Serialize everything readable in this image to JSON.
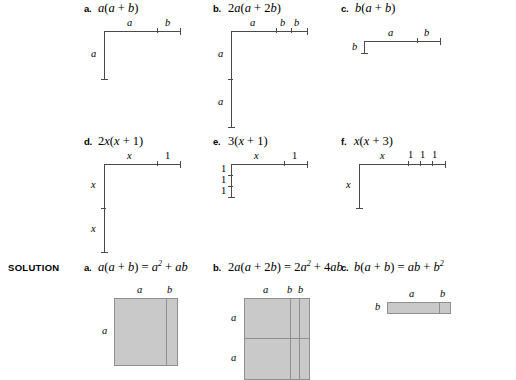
{
  "page": {
    "solution_tag": "SOLUTION"
  },
  "problems": [
    {
      "letter": "a.",
      "expression": "a(a + b)",
      "expr_parts": [
        "a",
        "(",
        "a",
        " + ",
        "b",
        ")"
      ],
      "horizontal_labels": [
        "a",
        "b"
      ],
      "vertical_labels": [
        "a"
      ]
    },
    {
      "letter": "b.",
      "expression": "2a(a + 2b)",
      "horizontal_labels": [
        "a",
        "b",
        "b"
      ],
      "vertical_labels": [
        "a",
        "a"
      ]
    },
    {
      "letter": "c.",
      "expression": "b(a + b)",
      "horizontal_labels": [
        "a",
        "b"
      ],
      "vertical_labels": [
        "b"
      ]
    },
    {
      "letter": "d.",
      "expression": "2x(x + 1)",
      "horizontal_labels": [
        "x",
        "1"
      ],
      "vertical_labels": [
        "x",
        "x"
      ]
    },
    {
      "letter": "e.",
      "expression": "3(x + 1)",
      "horizontal_labels": [
        "x",
        "1"
      ],
      "vertical_labels": [
        "1",
        "1",
        "1"
      ]
    },
    {
      "letter": "f.",
      "expression": "x(x + 3)",
      "horizontal_labels": [
        "x",
        "1",
        "1",
        "1"
      ],
      "vertical_labels": [
        "x"
      ]
    }
  ],
  "solutions": [
    {
      "letter": "a.",
      "equation_lhs": "a(a + b)",
      "equation_rhs_1": "a",
      "equation_rhs_1_exp": "2",
      "equation_rhs_2": "ab",
      "equation_full": "a(a + b) = a2 + ab",
      "horizontal_labels": [
        "a",
        "b"
      ],
      "vertical_labels": [
        "a"
      ]
    },
    {
      "letter": "b.",
      "equation_lhs": "2a(a + 2b)",
      "equation_rhs_1": "2a",
      "equation_rhs_1_exp": "2",
      "equation_rhs_2": "4ab",
      "equation_full": "2a(a + 2b) = 2a2 + 4ab",
      "horizontal_labels": [
        "a",
        "b",
        "b"
      ],
      "vertical_labels": [
        "a",
        "a"
      ]
    },
    {
      "letter": "c.",
      "equation_lhs": "b(a + b)",
      "equation_rhs_1": "ab",
      "equation_rhs_2": "b",
      "equation_rhs_2_exp": "2",
      "equation_full": "b(a + b) = ab + b2",
      "horizontal_labels": [
        "a",
        "b"
      ],
      "vertical_labels": [
        "b"
      ]
    }
  ],
  "colors": {
    "fill": "#c9c9c9",
    "stroke": "#8f8f8f",
    "line": "#4a4a4a",
    "text": "#000000",
    "background": "#ffffff"
  }
}
